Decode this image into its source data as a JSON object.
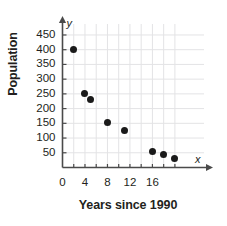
{
  "chart_data": {
    "type": "scatter",
    "title": "",
    "xlabel": "Years since 1990",
    "ylabel": "Population",
    "x_axis_variable": "x",
    "y_axis_variable": "y",
    "xlim": [
      0,
      20.5
    ],
    "ylim": [
      0,
      470
    ],
    "grid": true,
    "grid_color": "#e3e3e5",
    "point_color": "#1a1a1a",
    "axis_color": "#4a4a4a",
    "x_ticks": [
      0,
      2,
      4,
      6,
      8,
      10,
      12,
      14,
      16,
      18,
      20
    ],
    "x_tick_labels": [
      "0",
      "",
      "4",
      "",
      "8",
      "",
      "12",
      "",
      "16",
      "",
      ""
    ],
    "y_ticks": [
      0,
      50,
      100,
      150,
      200,
      250,
      300,
      350,
      400,
      450
    ],
    "y_tick_labels": [
      "",
      "50",
      "100",
      "150",
      "200",
      "250",
      "300",
      "350",
      "400",
      "450"
    ],
    "points": [
      {
        "x": 2,
        "y": 400
      },
      {
        "x": 4,
        "y": 250
      },
      {
        "x": 5,
        "y": 230
      },
      {
        "x": 8,
        "y": 152
      },
      {
        "x": 11,
        "y": 127
      },
      {
        "x": 16,
        "y": 53
      },
      {
        "x": 18,
        "y": 45
      },
      {
        "x": 20,
        "y": 30
      }
    ]
  }
}
